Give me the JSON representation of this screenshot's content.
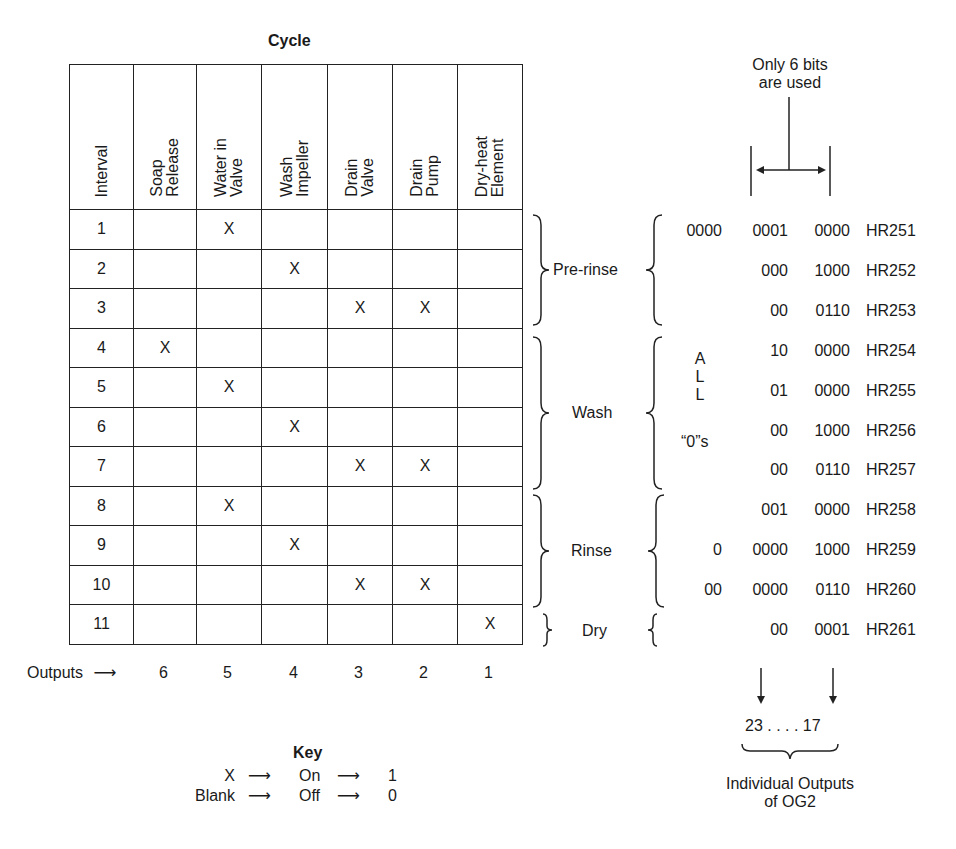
{
  "diagram": {
    "title": "Cycle",
    "table": {
      "headers": [
        "Interval",
        "Soap\nRelease",
        "Water in\nValve",
        "Wash\nImpeller",
        "Drain\nValve",
        "Drain\nPump",
        "Dry-heat\nElement"
      ],
      "rows": [
        {
          "interval": "1",
          "cells": [
            "",
            "X",
            "",
            "",
            "",
            ""
          ]
        },
        {
          "interval": "2",
          "cells": [
            "",
            "",
            "X",
            "",
            "",
            ""
          ]
        },
        {
          "interval": "3",
          "cells": [
            "",
            "",
            "",
            "X",
            "X",
            ""
          ]
        },
        {
          "interval": "4",
          "cells": [
            "X",
            "",
            "",
            "",
            "",
            ""
          ]
        },
        {
          "interval": "5",
          "cells": [
            "",
            "X",
            "",
            "",
            "",
            ""
          ]
        },
        {
          "interval": "6",
          "cells": [
            "",
            "",
            "X",
            "",
            "",
            ""
          ]
        },
        {
          "interval": "7",
          "cells": [
            "",
            "",
            "",
            "X",
            "X",
            ""
          ]
        },
        {
          "interval": "8",
          "cells": [
            "",
            "X",
            "",
            "",
            "",
            ""
          ]
        },
        {
          "interval": "9",
          "cells": [
            "",
            "",
            "X",
            "",
            "",
            ""
          ]
        },
        {
          "interval": "10",
          "cells": [
            "",
            "",
            "",
            "X",
            "X",
            ""
          ]
        },
        {
          "interval": "11",
          "cells": [
            "",
            "",
            "",
            "",
            "",
            "X"
          ]
        }
      ]
    },
    "outputs_row": {
      "label": "Outputs",
      "arrow": "⟶",
      "values": [
        "6",
        "5",
        "4",
        "3",
        "2",
        "1"
      ]
    },
    "phases": [
      {
        "name": "Pre-rinse",
        "rows": [
          1,
          3
        ]
      },
      {
        "name": "Wash",
        "rows": [
          4,
          7
        ]
      },
      {
        "name": "Rinse",
        "rows": [
          8,
          10
        ]
      },
      {
        "name": "Dry",
        "rows": [
          11,
          11
        ]
      }
    ],
    "bit_note": {
      "line1": "Only 6 bits",
      "line2": "are used"
    },
    "registers": [
      {
        "c1": "0000",
        "c2": "0001",
        "c3": "0000",
        "reg": "HR251"
      },
      {
        "c1": "",
        "c2": "000",
        "c3": "1000",
        "reg": "HR252"
      },
      {
        "c1": "",
        "c2": "00",
        "c3": "0110",
        "reg": "HR253"
      },
      {
        "c1": "",
        "c2": "10",
        "c3": "0000",
        "reg": "HR254"
      },
      {
        "c1": "",
        "c2": "01",
        "c3": "0000",
        "reg": "HR255"
      },
      {
        "c1": "",
        "c2": "00",
        "c3": "1000",
        "reg": "HR256"
      },
      {
        "c1": "",
        "c2": "00",
        "c3": "0110",
        "reg": "HR257"
      },
      {
        "c1": "",
        "c2": "001",
        "c3": "0000",
        "reg": "HR258"
      },
      {
        "c1": "0",
        "c2": "0000",
        "c3": "1000",
        "reg": "HR259"
      },
      {
        "c1": "00",
        "c2": "0000",
        "c3": "0110",
        "reg": "HR260"
      },
      {
        "c1": "",
        "c2": "00",
        "c3": "0001",
        "reg": "HR261"
      }
    ],
    "all_zeros_note": {
      "letters": [
        "A",
        "L",
        "L"
      ],
      "zeros": "“0”s"
    },
    "og2": {
      "range": "23 . . . . 17",
      "line1": "Individual Outputs",
      "line2": "of OG2"
    },
    "key": {
      "title": "Key",
      "rows": [
        {
          "symbol": "X",
          "state": "On",
          "bit": "1"
        },
        {
          "symbol": "Blank",
          "state": "Off",
          "bit": "0"
        }
      ],
      "arrow": "⟶"
    }
  }
}
